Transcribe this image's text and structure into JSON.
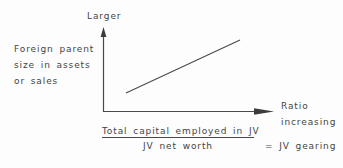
{
  "diagram": {
    "y_axis": {
      "top_label": "Larger",
      "description_lines": [
        "Foreign parent",
        "size in assets",
        "or sales"
      ]
    },
    "x_axis": {
      "description_lines": [
        "Ratio",
        "increasing"
      ]
    },
    "formula": {
      "numerator": "Total capital employed in JV",
      "denominator": "JV net worth",
      "equals": "= JV gearing"
    },
    "colors": {
      "ink": "#444444",
      "axis": "#4a4a4a",
      "background": "#fdfdfd"
    }
  }
}
